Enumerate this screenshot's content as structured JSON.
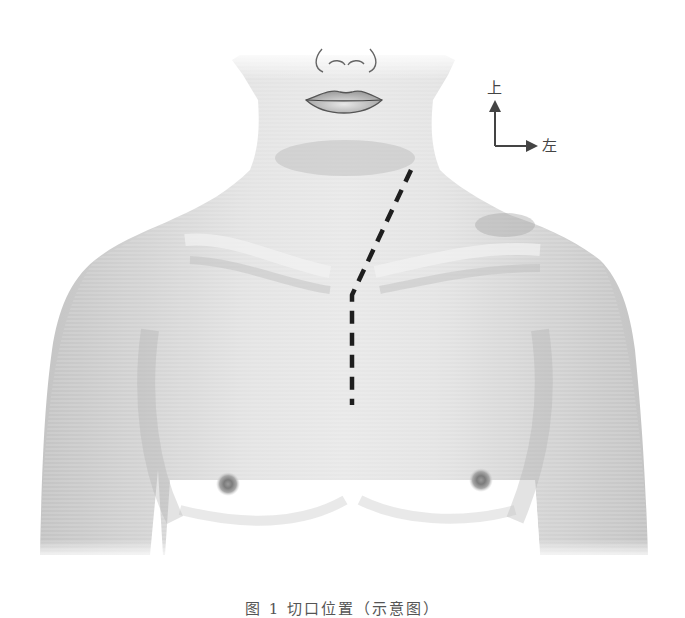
{
  "figure": {
    "direction_indicator": {
      "up_label": "上",
      "left_label": "左"
    },
    "incision": {
      "style": "dashed",
      "color": "#1e1e1e",
      "path_points": [
        [
          411,
          170
        ],
        [
          352,
          295
        ],
        [
          352,
          405
        ]
      ]
    },
    "caption": "图 1  切口位置（示意图）",
    "colors": {
      "skin": "#d9d9d9",
      "skin_highlight": "#efefef",
      "skin_shadow": "#b9b9b9",
      "outline": "#555555",
      "background": "#ffffff"
    }
  }
}
